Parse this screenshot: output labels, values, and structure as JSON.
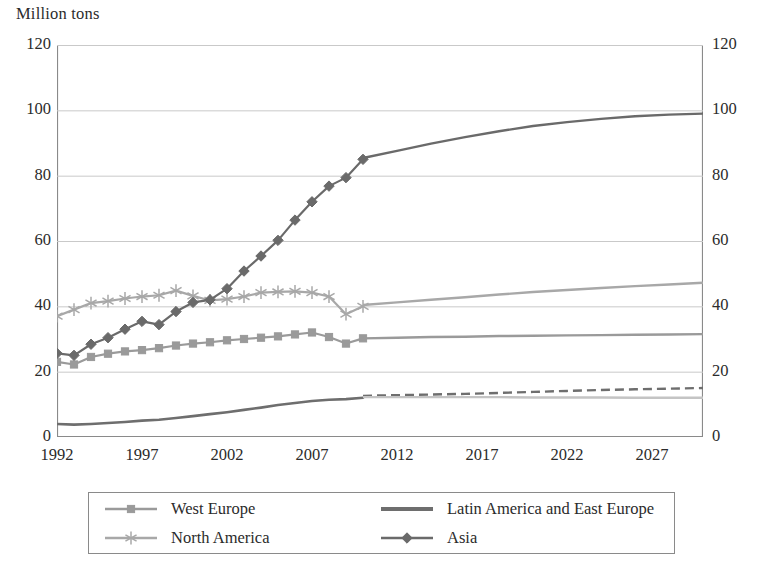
{
  "chart_data": {
    "type": "line",
    "title": "",
    "ylabel": "Million tons",
    "xlabel": "",
    "ylim": [
      0,
      120
    ],
    "yticks": [
      0,
      20,
      40,
      60,
      80,
      100,
      120
    ],
    "dual_axis": true,
    "grid": true,
    "xlim": [
      1992,
      2030
    ],
    "xticks": [
      1992,
      1997,
      2002,
      2007,
      2012,
      2017,
      2022,
      2027
    ],
    "xtick_labels": [
      "1992",
      "1997",
      "2002",
      "2007",
      "2012",
      "2017",
      "2022",
      "2027"
    ],
    "ytick_labels_left": [
      "0",
      "20",
      "40",
      "60",
      "80",
      "100",
      "120"
    ],
    "ytick_labels_right": [
      "0",
      "20",
      "40",
      "60",
      "80",
      "100",
      "120"
    ],
    "history_end_year": 2010,
    "legend_position": "bottom",
    "series": [
      {
        "name": "West Europe",
        "marker": "square",
        "color": "#9a9a9a",
        "history": {
          "x": [
            1992,
            1993,
            1994,
            1995,
            1996,
            1997,
            1998,
            1999,
            2000,
            2001,
            2002,
            2003,
            2004,
            2005,
            2006,
            2007,
            2008,
            2009,
            2010
          ],
          "y": [
            23.0,
            22.2,
            24.5,
            25.5,
            26.2,
            26.6,
            27.2,
            28.0,
            28.6,
            29.0,
            29.6,
            30.0,
            30.4,
            30.8,
            31.4,
            32.0,
            30.6,
            28.6,
            30.2
          ]
        },
        "forecast": {
          "x": [
            2010,
            2012,
            2014,
            2016,
            2018,
            2020,
            2022,
            2024,
            2026,
            2028,
            2030
          ],
          "y": [
            30.2,
            30.4,
            30.6,
            30.7,
            30.9,
            31.0,
            31.1,
            31.2,
            31.3,
            31.4,
            31.5
          ],
          "style": "solid"
        }
      },
      {
        "name": "Latin America and East Europe",
        "marker": "none",
        "color": "#6e6e6e",
        "history": {
          "x": [
            1992,
            1993,
            1994,
            1995,
            1996,
            1997,
            1998,
            1999,
            2000,
            2001,
            2002,
            2003,
            2004,
            2005,
            2006,
            2007,
            2008,
            2009,
            2010
          ],
          "y": [
            4.0,
            3.8,
            4.0,
            4.3,
            4.6,
            5.0,
            5.3,
            5.8,
            6.4,
            7.0,
            7.6,
            8.3,
            9.0,
            9.8,
            10.4,
            11.0,
            11.4,
            11.6,
            12.0
          ]
        },
        "forecast": {
          "x": [
            2010,
            2012,
            2014,
            2016,
            2018,
            2020,
            2022,
            2024,
            2026,
            2028,
            2030
          ],
          "y": [
            12.6,
            12.8,
            13.0,
            13.2,
            13.5,
            13.8,
            14.1,
            14.4,
            14.6,
            14.8,
            15.0
          ],
          "style": "dashed"
        }
      },
      {
        "name": "North America",
        "marker": "asterisk",
        "color": "#a8a8a8",
        "history": {
          "x": [
            1992,
            1993,
            1994,
            1995,
            1996,
            1997,
            1998,
            1999,
            2000,
            2001,
            2002,
            2003,
            2004,
            2005,
            2006,
            2007,
            2008,
            2009,
            2010
          ],
          "y": [
            37.0,
            39.0,
            41.0,
            41.6,
            42.4,
            43.0,
            43.4,
            44.8,
            43.2,
            41.8,
            42.2,
            43.0,
            44.2,
            44.4,
            44.6,
            44.2,
            43.0,
            37.6,
            40.0
          ]
        },
        "forecast": {
          "x": [
            2010,
            2012,
            2014,
            2016,
            2018,
            2020,
            2022,
            2024,
            2026,
            2028,
            2030
          ],
          "y": [
            40.4,
            41.2,
            42.0,
            42.8,
            43.6,
            44.4,
            45.0,
            45.6,
            46.2,
            46.7,
            47.2
          ],
          "style": "solid"
        }
      },
      {
        "name": "Asia",
        "marker": "diamond",
        "color": "#6a6a6a",
        "history": {
          "x": [
            1992,
            1993,
            1994,
            1995,
            1996,
            1997,
            1998,
            1999,
            2000,
            2001,
            2002,
            2003,
            2004,
            2005,
            2006,
            2007,
            2008,
            2009,
            2010
          ],
          "y": [
            25.6,
            25.0,
            28.4,
            30.4,
            33.0,
            35.4,
            34.4,
            38.4,
            41.2,
            42.0,
            45.4,
            50.8,
            55.4,
            60.2,
            66.4,
            72.0,
            76.8,
            79.4,
            85.0
          ]
        },
        "forecast": {
          "x": [
            2010,
            2012,
            2014,
            2016,
            2018,
            2020,
            2022,
            2024,
            2026,
            2028,
            2030
          ],
          "y": [
            85.4,
            87.6,
            89.8,
            91.8,
            93.6,
            95.2,
            96.4,
            97.4,
            98.2,
            98.7,
            99.0
          ],
          "style": "solid"
        }
      },
      {
        "name": "secondary-low-line",
        "marker": "none",
        "color": "#c4c4c4",
        "history": {
          "x": [],
          "y": []
        },
        "forecast": {
          "x": [
            2010,
            2012,
            2014,
            2016,
            2018,
            2020,
            2022,
            2024,
            2026,
            2028,
            2030
          ],
          "y": [
            12.2,
            12.2,
            12.2,
            12.2,
            12.2,
            12.1,
            12.1,
            12.1,
            12.0,
            12.0,
            12.0
          ],
          "style": "solid"
        }
      }
    ]
  },
  "legend": {
    "entries": [
      {
        "label": "West Europe",
        "marker": "square",
        "color": "#9a9a9a"
      },
      {
        "label": "Latin America and East Europe",
        "marker": "none",
        "color": "#6e6e6e"
      },
      {
        "label": "North America",
        "marker": "asterisk",
        "color": "#a8a8a8"
      },
      {
        "label": "Asia",
        "marker": "diamond",
        "color": "#6a6a6a"
      }
    ]
  },
  "colors": {
    "axis": "#8a8a8a",
    "grid": "#c9c9c9",
    "text": "#2b2b2b",
    "background": "#ffffff"
  }
}
